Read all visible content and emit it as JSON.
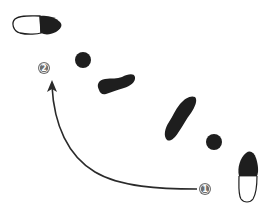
{
  "diagram": {
    "type": "dance-step-footprints",
    "background": "#ffffff",
    "ink_color": "#1e1e1e",
    "badge_color": "#6e6e6e",
    "badges": [
      {
        "label": "1",
        "x": 205,
        "y": 189
      },
      {
        "label": "2",
        "x": 44,
        "y": 68
      }
    ],
    "dots": [
      {
        "x": 83,
        "y": 60,
        "r": 8
      },
      {
        "x": 214,
        "y": 142,
        "r": 8
      }
    ],
    "footprints": [
      {
        "id": "start-right-shoe",
        "style": "half-filled",
        "position": "bottom-right"
      },
      {
        "id": "step-foot-1",
        "style": "filled",
        "position": "center-right"
      },
      {
        "id": "step-foot-2",
        "style": "filled",
        "position": "center"
      },
      {
        "id": "end-shoe",
        "style": "half-filled",
        "position": "top-left"
      }
    ],
    "arrow": {
      "from_badge": "1",
      "to_badge": "2",
      "direction": "curved counter-clockwise upward"
    }
  }
}
